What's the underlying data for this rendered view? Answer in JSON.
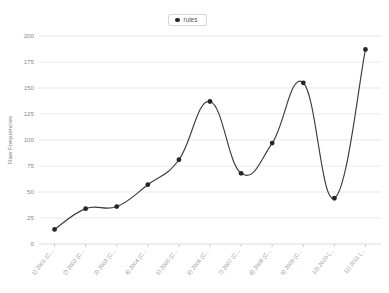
{
  "chart_data": {
    "type": "line",
    "title": "",
    "subtitle": "",
    "xlabel": "",
    "ylabel": "Raw Frequencies",
    "ylim": [
      0,
      200
    ],
    "yticks": [
      0,
      25,
      50,
      75,
      100,
      125,
      150,
      175,
      200
    ],
    "grid": true,
    "legend_position": "top-center",
    "interpolation": "smooth-spline",
    "marker": "filled-circle",
    "line_color": "#3c3c3c",
    "marker_color": "#262626",
    "grid_color": "#e9e9e9",
    "background_color": "#ffffff",
    "categories": [
      "1) 2001 (C...",
      "2) 2002 (C...",
      "3) 2003 (C...",
      "4) 2004 (C...",
      "5) 2005 (C...",
      "6) 2006 (C...",
      "7) 2007 (C...",
      "8) 2008 (C...",
      "9) 2009 (C...",
      "10) 2010 (...",
      "11) 2011 (..."
    ],
    "series": [
      {
        "name": "rules",
        "values": [
          14,
          34,
          36,
          57,
          81,
          137,
          68,
          97,
          155,
          44,
          187
        ]
      }
    ]
  },
  "legend": {
    "entries": [
      {
        "label": "rules",
        "marker": "filled-circle-icon",
        "color": "#262626"
      }
    ]
  },
  "axes": {
    "y": {
      "label": "Raw Frequencies",
      "tick_labels": [
        "0",
        "25",
        "50",
        "75",
        "100",
        "125",
        "150",
        "175",
        "200"
      ]
    },
    "x": {
      "label": "",
      "tick_labels": [
        "1) 2001 (C...",
        "2) 2002 (C...",
        "3) 2003 (C...",
        "4) 2004 (C...",
        "5) 2005 (C...",
        "6) 2006 (C...",
        "7) 2007 (C...",
        "8) 2008 (C...",
        "9) 2009 (C...",
        "10) 2010 (...",
        "11) 2011 (..."
      ]
    }
  }
}
